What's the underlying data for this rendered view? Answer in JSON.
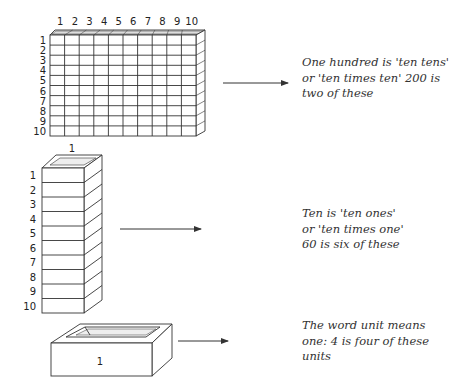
{
  "blocks": [
    {
      "name": "hundred",
      "top_labels": [
        "1",
        "2",
        "3",
        "4",
        "5",
        "6",
        "7",
        "8",
        "9",
        "10"
      ],
      "side_labels": [
        "1",
        "2",
        "3",
        "4",
        "5",
        "6",
        "7",
        "8",
        "9",
        "10"
      ],
      "caption": [
        "One hundred is 'ten tens'",
        "or 'ten times ten' 200 is",
        "two of these"
      ]
    },
    {
      "name": "ten",
      "top_labels": [
        "1"
      ],
      "side_labels": [
        "1",
        "2",
        "3",
        "4",
        "5",
        "6",
        "7",
        "8",
        "9",
        "10"
      ],
      "caption": [
        "Ten is 'ten ones'",
        "or 'ten times one'",
        "60 is six of these"
      ]
    },
    {
      "name": "unit",
      "face_label": "1",
      "caption": [
        "The word unit means",
        "one: 4 is four of these",
        "units"
      ]
    }
  ],
  "colors": {
    "line": "#333333",
    "text": "#333333",
    "background": "#ffffff"
  }
}
